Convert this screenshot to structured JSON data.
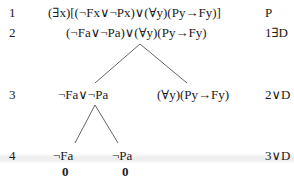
{
  "proof_tree": {
    "rows": [
      {
        "line_number": "1",
        "formulas": [
          "(∃x)[(¬Fx∨¬Px)∨(∀y)(Py→Fy)]"
        ],
        "justification": "P"
      },
      {
        "line_number": "2",
        "formulas": [
          "(¬Fa∨¬Pa)∨(∀y)(Py→Fy)"
        ],
        "justification": "1∃D"
      },
      {
        "line_number": "3",
        "formulas": [
          "¬Fa∨¬Pa",
          "(∀y)(Py→Fy)"
        ],
        "justification": "2∨D"
      },
      {
        "line_number": "4",
        "formulas": [
          "¬Fa",
          "¬Pa"
        ],
        "justification": "3∨D"
      }
    ],
    "branch_marks": [
      "0",
      "0"
    ],
    "colors": {
      "text": "#1a1a1a",
      "lines": "#555555"
    }
  }
}
